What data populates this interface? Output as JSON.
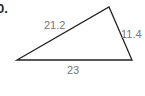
{
  "problem": {
    "number": "0."
  },
  "triangle": {
    "vertices": {
      "left": [
        17,
        60
      ],
      "top": [
        109,
        7
      ],
      "right": [
        132,
        60
      ]
    },
    "sides": {
      "left_side": "21.2",
      "right_side": "11.4",
      "base": "23"
    },
    "stroke_color": "#222222",
    "label_color": "#777777"
  }
}
